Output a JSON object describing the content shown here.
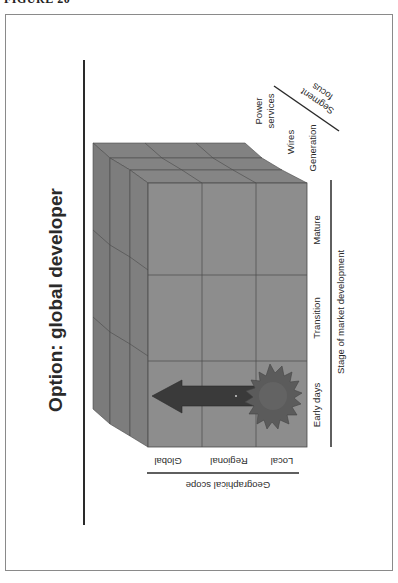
{
  "figure_label": "FIGURE 20",
  "title": "Option:  global developer",
  "axes": {
    "geographical_scope": {
      "label": "Geographical scope",
      "ticks": [
        "Global",
        "Regional",
        "Local"
      ]
    },
    "market_stage": {
      "label": "Stage of market development",
      "ticks": [
        "Early days",
        "Transition",
        "Mature"
      ]
    },
    "segment_focus": {
      "label": "Segment focus",
      "ticks": [
        "Power services",
        "Wires",
        "Generation"
      ],
      "tick_lines": {
        "power_services": [
          "Power",
          "services"
        ]
      }
    }
  },
  "annotation": {
    "start_marker": "starburst",
    "start_cell": "Local / Early days",
    "arrow_direction": "toward Global",
    "end_cell": "Global / Early days"
  },
  "colors": {
    "cube_face": "#8d8d8d",
    "cube_top": "#7f7f7f",
    "cube_side": "#7a7a7a",
    "grid_line": "#4a4a4a",
    "arrow": "#3a3a3a",
    "starburst": "#5a5a5a",
    "text": "#2a2a2a"
  }
}
